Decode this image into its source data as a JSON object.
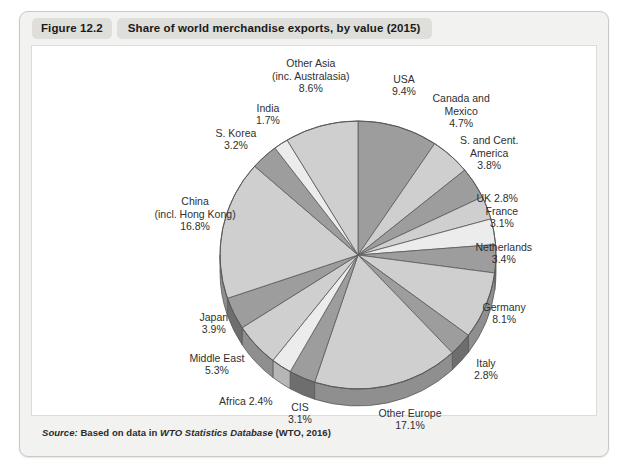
{
  "figure": {
    "number": "Figure 12.2",
    "title": "Share of world merchandise exports, by value (2015)",
    "source_prefix": "Source:",
    "source_text_before": "Based on data in",
    "source_italic": "WTO Statistics Database",
    "source_text_after": "(WTO, 2016)"
  },
  "colors": {
    "slice_dark": "#9d9d9d",
    "slice_light": "#cfcfcf",
    "slice_pale": "#ececec",
    "slice_edge": "#5a5a5a",
    "side_dark": "#6e6e6e",
    "side_light": "#8f8f8f",
    "panel_bg": "#f2f2f0",
    "pill_bg": "#dededa",
    "plot_bg": "#ffffff"
  },
  "chart_data": {
    "type": "pie",
    "title": "Share of world merchandise exports, by value (2015)",
    "unit": "%",
    "legend_position": "none",
    "labels_outside": true,
    "categories": [
      "USA",
      "Canada and Mexico",
      "S. and Cent. America",
      "UK",
      "France",
      "Netherlands",
      "Germany",
      "Italy",
      "Other Europe",
      "CIS",
      "Africa",
      "Middle East",
      "Japan",
      "China (incl. Hong Kong)",
      "S. Korea",
      "India",
      "Other Asia (inc. Australasia)"
    ],
    "values": [
      9.4,
      4.7,
      3.8,
      2.8,
      3.1,
      3.4,
      8.1,
      2.8,
      17.1,
      3.1,
      2.4,
      5.3,
      3.9,
      16.8,
      3.2,
      1.7,
      8.6
    ],
    "slices": [
      {
        "id": "usa",
        "label_lines": [
          "USA",
          "9.4%"
        ],
        "value": 9.4,
        "shade": "dark",
        "label_x": 383,
        "label_y": 72,
        "align": "ctr"
      },
      {
        "id": "canada-mexico",
        "label_lines": [
          "Canada and",
          "Mexico",
          "4.7%"
        ],
        "value": 4.7,
        "shade": "light",
        "label_x": 440,
        "label_y": 98,
        "align": "ctr"
      },
      {
        "id": "s-cent-america",
        "label_lines": [
          "S. and Cent.",
          "America",
          "3.8%"
        ],
        "value": 3.8,
        "shade": "dark",
        "label_x": 468,
        "label_y": 140,
        "align": "ctr"
      },
      {
        "id": "uk",
        "label_lines": [
          "UK 2.8%"
        ],
        "value": 2.8,
        "shade": "light",
        "label_x": 476,
        "label_y": 185,
        "align": "ctr"
      },
      {
        "id": "france",
        "label_lines": [
          "France",
          "3.1%"
        ],
        "value": 3.1,
        "shade": "pale",
        "label_x": 481,
        "label_y": 204,
        "align": "ctr"
      },
      {
        "id": "netherlands",
        "label_lines": [
          "Netherlands",
          "3.4%"
        ],
        "value": 3.4,
        "shade": "dark",
        "label_x": 483,
        "label_y": 240,
        "align": "ctr"
      },
      {
        "id": "germany",
        "label_lines": [
          "Germany",
          "8.1%"
        ],
        "value": 8.1,
        "shade": "light",
        "label_x": 483,
        "label_y": 300,
        "align": "ctr"
      },
      {
        "id": "italy",
        "label_lines": [
          "Italy",
          "2.8%"
        ],
        "value": 2.8,
        "shade": "dark",
        "label_x": 465,
        "label_y": 356,
        "align": "ctr"
      },
      {
        "id": "other-europe",
        "label_lines": [
          "Other Europe",
          "17.1%"
        ],
        "value": 17.1,
        "shade": "light",
        "label_x": 389,
        "label_y": 406,
        "align": "ctr"
      },
      {
        "id": "cis",
        "label_lines": [
          "CIS",
          "3.1%"
        ],
        "value": 3.1,
        "shade": "dark",
        "label_x": 279,
        "label_y": 400,
        "align": "ctr"
      },
      {
        "id": "africa",
        "label_lines": [
          "Africa 2.4%"
        ],
        "value": 2.4,
        "shade": "pale",
        "label_x": 225,
        "label_y": 388,
        "align": "ctr"
      },
      {
        "id": "middle-east",
        "label_lines": [
          "Middle East",
          "5.3%"
        ],
        "value": 5.3,
        "shade": "light",
        "label_x": 196,
        "label_y": 351,
        "align": "ctr"
      },
      {
        "id": "japan",
        "label_lines": [
          "Japan",
          "3.9%"
        ],
        "value": 3.9,
        "shade": "dark",
        "label_x": 193,
        "label_y": 310,
        "align": "ctr"
      },
      {
        "id": "china",
        "label_lines": [
          "China",
          "(incl. Hong Kong)",
          "16.8%"
        ],
        "value": 16.8,
        "shade": "light",
        "label_x": 174,
        "label_y": 201,
        "align": "ctr"
      },
      {
        "id": "s-korea",
        "label_lines": [
          "S. Korea",
          "3.2%"
        ],
        "value": 3.2,
        "shade": "dark",
        "label_x": 215,
        "label_y": 126,
        "align": "ctr"
      },
      {
        "id": "india",
        "label_lines": [
          "India",
          "1.7%"
        ],
        "value": 1.7,
        "shade": "pale",
        "label_x": 247,
        "label_y": 101,
        "align": "ctr"
      },
      {
        "id": "other-asia",
        "label_lines": [
          "Other Asia",
          "(inc. Australasia)",
          "8.6%"
        ],
        "value": 8.6,
        "shade": "light",
        "label_x": 290,
        "label_y": 63,
        "align": "ctr"
      }
    ],
    "geometry": {
      "cx": 337,
      "cy": 242,
      "rx": 138,
      "ry": 134,
      "depth": 17,
      "start_angle_deg": -90
    }
  }
}
